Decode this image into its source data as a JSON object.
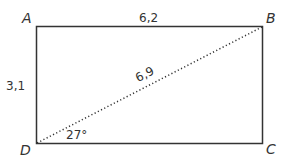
{
  "diagram": {
    "type": "rectangle-with-diagonal",
    "vertices": {
      "A": "A",
      "B": "B",
      "C": "C",
      "D": "D"
    },
    "side_labels": {
      "AB": "6,2",
      "AD": "3,1",
      "BD": "6,9"
    },
    "angle_label": "27°",
    "colors": {
      "stroke": "#333333",
      "background": "#ffffff"
    }
  }
}
